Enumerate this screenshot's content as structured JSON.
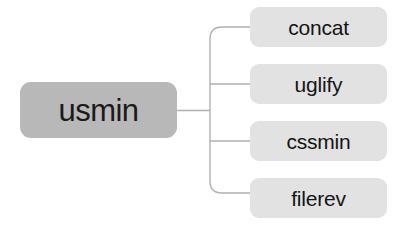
{
  "diagram": {
    "type": "tree",
    "orientation": "left-to-right",
    "background_color": "#ffffff",
    "connector_color": "#b0b0b0",
    "root": {
      "label": "usmin",
      "fill_color": "#b8b8b8",
      "text_color": "#1a1a1a"
    },
    "children": [
      {
        "label": "concat",
        "fill_color": "#e2e2e2",
        "text_color": "#141414"
      },
      {
        "label": "uglify",
        "fill_color": "#e2e2e2",
        "text_color": "#141414"
      },
      {
        "label": "cssmin",
        "fill_color": "#e2e2e2",
        "text_color": "#141414"
      },
      {
        "label": "filerev",
        "fill_color": "#e2e2e2",
        "text_color": "#141414"
      }
    ]
  }
}
